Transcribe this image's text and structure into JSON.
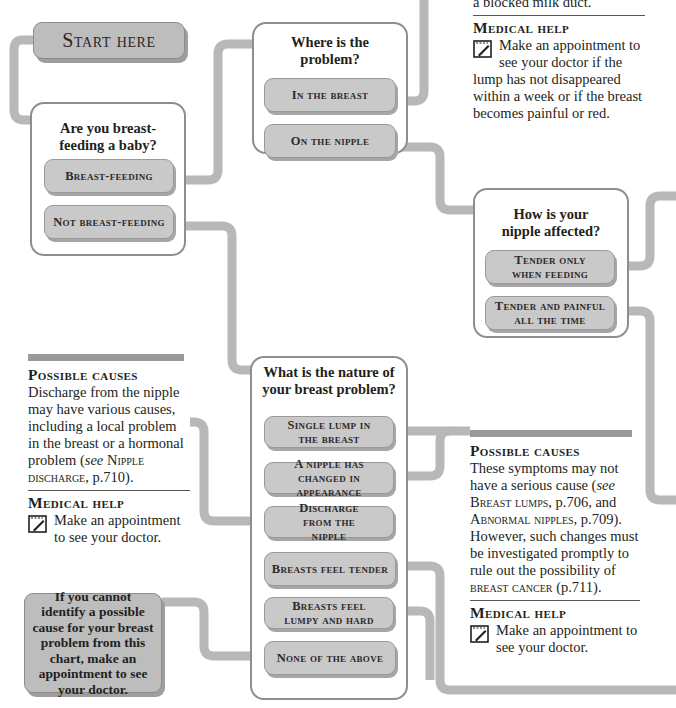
{
  "intro_text": "right away if possible if the problem persists with treatment...",
  "start": {
    "label": "Start here"
  },
  "q_breastfeeding": {
    "title": "Are you breast-feeding a baby?",
    "options": [
      "Breast-feeding",
      "Not breast-feeding"
    ]
  },
  "q_where": {
    "title": "Where is the problem?",
    "options": [
      "In the breast",
      "On the nipple"
    ]
  },
  "q_nipple": {
    "title": "How is your nipple affected?",
    "options": [
      "Tender only when feeding",
      "Tender and painful all the time"
    ]
  },
  "q_nature": {
    "title": "What is the nature of your breast problem?",
    "options": [
      "Single lump in the breast",
      "A nipple has changed in appearance",
      "Discharge from the nipple",
      "Breasts feel tender",
      "Breasts feel lumpy and hard",
      "None of the above"
    ]
  },
  "info_top_right": {
    "cause_tail": "a blocked milk duct.",
    "help_heading": "Medical help",
    "help_text": "Make an appointment to see your doctor if the lump has not disappeared within a week or if the breast becomes painful or red."
  },
  "info_left": {
    "cause_heading": "Possible causes",
    "cause_text_1": "Discharge from the nipple may have various causes, including a local problem in the breast or a hormonal problem (",
    "cause_see": "see",
    "cause_ref": "Nipple discharge",
    "cause_ref_page": ", p.710).",
    "help_heading": "Medical help",
    "help_text": "Make an appointment to see your doctor."
  },
  "info_right": {
    "cause_heading": "Possible causes",
    "cause_text_1": "These symptoms may not have a serious cause (",
    "cause_see": "see",
    "ref1": "Breast lumps",
    "ref1_page": ", p.706, and",
    "ref2": "Abnormal nipples",
    "ref2_page": ", p.709).",
    "cause_text_2": "However, such changes must be investigated promptly to rule out the possibility of",
    "ref3": "breast cancer",
    "ref3_page": " (p.711).",
    "help_heading": "Medical help",
    "help_text": "Make an appointment to see your doctor."
  },
  "final_box": {
    "text": "If you cannot identify a possible cause for your breast problem from this chart, make an appointment to see your doctor."
  },
  "colors": {
    "connector": "#b8b8b8",
    "option_fill": "#c9c9c9",
    "box_border": "#8e8e8e",
    "rule_bar": "#9a9a9a"
  }
}
